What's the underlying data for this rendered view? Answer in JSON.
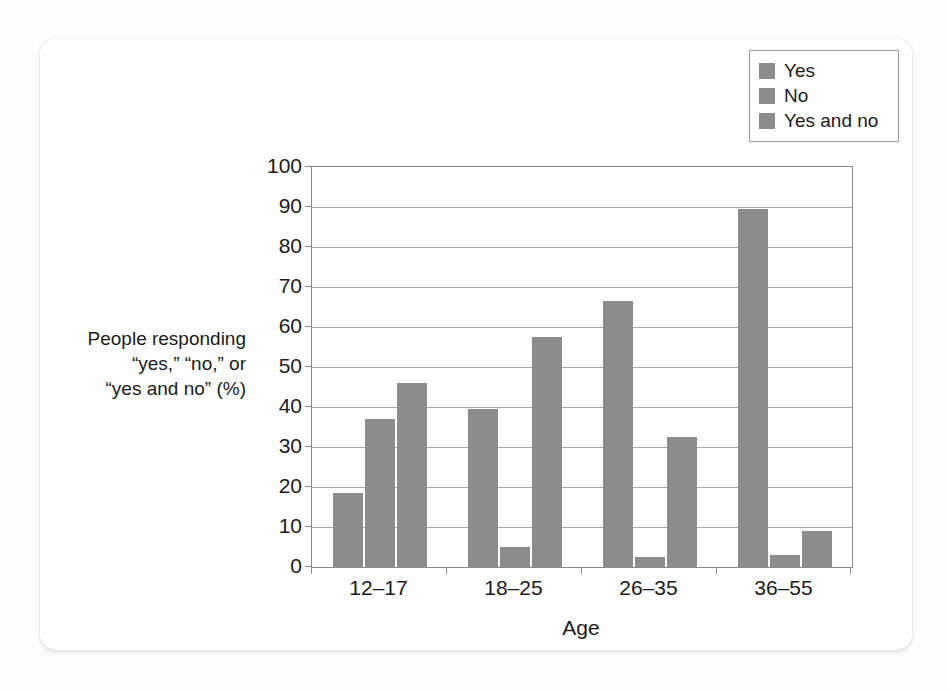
{
  "chart_data": {
    "type": "bar",
    "title": "",
    "xlabel": "Age",
    "ylabel": "People responding \"yes,\" \"no,\" or \"yes and no\" (%)",
    "ylabel_lines": [
      "People responding",
      "“yes,” “no,” or",
      "“yes and no” (%)"
    ],
    "categories": [
      "12–17",
      "18–25",
      "26–35",
      "36–55"
    ],
    "series": [
      {
        "name": "Yes",
        "values": [
          18.5,
          39.5,
          66.5,
          89.5
        ],
        "color": "#8c8c8c"
      },
      {
        "name": "No",
        "values": [
          37,
          5,
          2.5,
          3
        ],
        "color": "#8c8c8c"
      },
      {
        "name": "Yes and no",
        "values": [
          46,
          57.5,
          32.5,
          9
        ],
        "color": "#8c8c8c"
      }
    ],
    "ylim": [
      0,
      100
    ],
    "ytick_values": [
      0,
      10,
      20,
      30,
      40,
      50,
      60,
      70,
      80,
      90,
      100
    ],
    "ytick_labels": [
      "0",
      "10",
      "20",
      "30",
      "40",
      "50",
      "60",
      "70",
      "80",
      "90",
      "100"
    ],
    "grid": true,
    "legend_position": "top-right",
    "legend_entries": [
      "Yes",
      "No",
      "Yes and no"
    ]
  },
  "colors": {
    "bar_fill": "#8c8c8c",
    "axis": "#8a8a8a",
    "gridline": "#a8a8a8",
    "text": "#1a1a1a",
    "card_background": "#ffffff",
    "page_background": "#fdfdfd"
  }
}
